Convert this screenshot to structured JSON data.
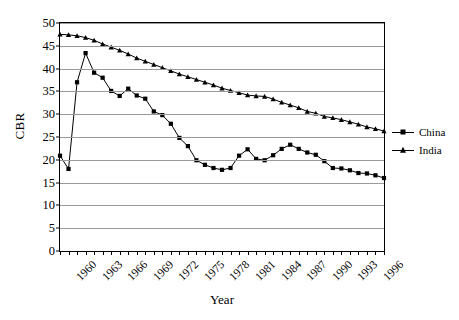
{
  "chart_data": {
    "type": "line",
    "title": "",
    "xlabel": "Year",
    "ylabel": "CBR",
    "xlim": [
      1960,
      1998
    ],
    "ylim": [
      0,
      50
    ],
    "ytick_values": [
      0,
      5,
      10,
      15,
      20,
      25,
      30,
      35,
      40,
      45,
      50
    ],
    "ytick_labels": [
      "0",
      "5",
      "10",
      "15",
      "20",
      "25",
      "30",
      "35",
      "40",
      "45",
      "50"
    ],
    "xtick_labels": [
      "1960",
      "1963",
      "1966",
      "1969",
      "1972",
      "1975",
      "1978",
      "1981",
      "1984",
      "1987",
      "1990",
      "1993",
      "1996"
    ],
    "xtick_values": [
      1960,
      1963,
      1966,
      1969,
      1972,
      1975,
      1978,
      1981,
      1984,
      1987,
      1990,
      1993,
      1996
    ],
    "grid": true,
    "legend_position": "right",
    "x": [
      1960,
      1961,
      1962,
      1963,
      1964,
      1965,
      1966,
      1967,
      1968,
      1969,
      1970,
      1971,
      1972,
      1973,
      1974,
      1975,
      1976,
      1977,
      1978,
      1979,
      1980,
      1981,
      1982,
      1983,
      1984,
      1985,
      1986,
      1987,
      1988,
      1989,
      1990,
      1991,
      1992,
      1993,
      1994,
      1995,
      1996,
      1997,
      1998
    ],
    "series": [
      {
        "name": "China",
        "marker": "square",
        "color": "#000000",
        "values": [
          20.9,
          18.0,
          37.0,
          43.4,
          39.1,
          38.0,
          35.1,
          34.0,
          35.6,
          34.1,
          33.4,
          30.6,
          29.8,
          27.9,
          24.8,
          23.0,
          19.9,
          18.9,
          18.2,
          17.8,
          18.2,
          20.9,
          22.3,
          20.2,
          19.9,
          21.0,
          22.4,
          23.3,
          22.4,
          21.6,
          21.1,
          19.7,
          18.2,
          18.1,
          17.7,
          17.1,
          17.0,
          16.6,
          16.0
        ]
      },
      {
        "name": "India",
        "marker": "triangle",
        "color": "#000000",
        "values": [
          47.5,
          47.4,
          47.2,
          46.8,
          46.2,
          45.4,
          44.7,
          44.0,
          43.2,
          42.3,
          41.6,
          40.9,
          40.2,
          39.5,
          38.8,
          38.2,
          37.6,
          37.0,
          36.4,
          35.7,
          35.2,
          34.7,
          34.2,
          34.0,
          33.9,
          33.3,
          32.6,
          32.0,
          31.4,
          30.6,
          30.2,
          29.5,
          29.2,
          28.8,
          28.3,
          27.8,
          27.2,
          26.8,
          26.3
        ]
      }
    ]
  },
  "legend": {
    "items": [
      {
        "label": "China"
      },
      {
        "label": "India"
      }
    ]
  }
}
